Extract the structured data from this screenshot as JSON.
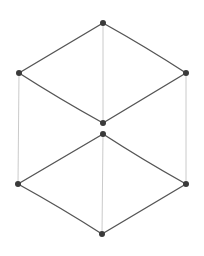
{
  "diagram": {
    "title": "",
    "nodes": [
      {
        "id": "top",
        "label": ""
      },
      {
        "id": "upper-left",
        "label": ""
      },
      {
        "id": "upper-right",
        "label": ""
      },
      {
        "id": "upper-bottom",
        "label": ""
      },
      {
        "id": "lower-top",
        "label": ""
      },
      {
        "id": "lower-left",
        "label": ""
      },
      {
        "id": "lower-right",
        "label": ""
      },
      {
        "id": "bottom",
        "label": ""
      }
    ],
    "edges": [
      {
        "from": "top",
        "to": "upper-left",
        "style": "thick"
      },
      {
        "from": "top",
        "to": "upper-right",
        "style": "thick"
      },
      {
        "from": "upper-left",
        "to": "upper-bottom",
        "style": "thick"
      },
      {
        "from": "upper-right",
        "to": "upper-bottom",
        "style": "thick"
      },
      {
        "from": "top",
        "to": "upper-bottom",
        "style": "thin"
      },
      {
        "from": "upper-left",
        "to": "lower-left",
        "style": "thin"
      },
      {
        "from": "upper-right",
        "to": "lower-right",
        "style": "thin"
      },
      {
        "from": "lower-top",
        "to": "lower-left",
        "style": "thick"
      },
      {
        "from": "lower-top",
        "to": "lower-right",
        "style": "thick"
      },
      {
        "from": "lower-left",
        "to": "bottom",
        "style": "thick"
      },
      {
        "from": "lower-right",
        "to": "bottom",
        "style": "thick"
      },
      {
        "from": "lower-top",
        "to": "bottom",
        "style": "thin"
      }
    ],
    "colors": {
      "edge": "#555555",
      "thin_edge": "#bdbdbd",
      "node": "#3a3a3a",
      "background": "#ffffff"
    }
  }
}
